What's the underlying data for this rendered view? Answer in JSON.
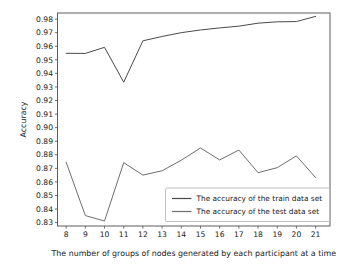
{
  "chart_data": {
    "type": "line",
    "title": "",
    "xlabel": "The number of groups of nodes generated by each participant at a time",
    "ylabel": "Accuracy",
    "x": [
      8,
      9,
      10,
      11,
      12,
      13,
      14,
      15,
      16,
      17,
      18,
      19,
      20,
      21
    ],
    "xtick_labels": [
      "8",
      "9",
      "10",
      "11",
      "12",
      "13",
      "14",
      "15",
      "16",
      "17",
      "18",
      "19",
      "20",
      "21"
    ],
    "ytick_labels": [
      "0.83",
      "0.84",
      "0.85",
      "0.86",
      "0.87",
      "0.88",
      "0.89",
      "0.90",
      "0.91",
      "0.92",
      "0.93",
      "0.94",
      "0.95",
      "0.96",
      "0.97",
      "0.98"
    ],
    "yticks": [
      0.83,
      0.84,
      0.85,
      0.86,
      0.87,
      0.88,
      0.89,
      0.9,
      0.91,
      0.92,
      0.93,
      0.94,
      0.95,
      0.96,
      0.97,
      0.98
    ],
    "xlim": [
      7.55,
      21.75
    ],
    "ylim": [
      0.8275,
      0.9845
    ],
    "grid": false,
    "legend_position": "lower right",
    "series": [
      {
        "name": "The accuracy of the train data set",
        "color": "#4a4a4a",
        "values": [
          0.9548,
          0.9547,
          0.9592,
          0.9335,
          0.964,
          0.9672,
          0.97,
          0.972,
          0.9735,
          0.9748,
          0.977,
          0.978,
          0.9782,
          0.982
        ]
      },
      {
        "name": "The accuracy of the test data set",
        "color": "#6e6e6e",
        "values": [
          0.8745,
          0.8352,
          0.8312,
          0.8742,
          0.865,
          0.8682,
          0.876,
          0.885,
          0.8762,
          0.8835,
          0.8668,
          0.8705,
          0.8792,
          0.8632
        ]
      }
    ]
  },
  "legend": {
    "entries": [
      "The accuracy of the train data set",
      "The accuracy of the test data set"
    ]
  }
}
